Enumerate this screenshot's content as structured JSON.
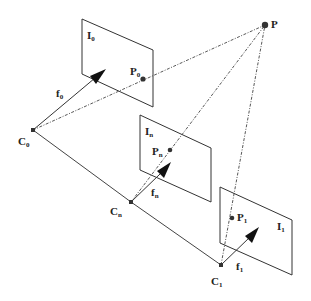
{
  "diagram": {
    "point": {
      "label": "P"
    },
    "cameras": [
      {
        "center_label": "C",
        "center_sub": "0",
        "focal_label": "f",
        "focal_sub": "0",
        "plane_label": "I",
        "plane_sub": "0",
        "projection_label": "P",
        "projection_sub": "0"
      },
      {
        "center_label": "C",
        "center_sub": "n",
        "focal_label": "f",
        "focal_sub": "n",
        "plane_label": "I",
        "plane_sub": "n",
        "projection_label": "P",
        "projection_sub": "n"
      },
      {
        "center_label": "C",
        "center_sub": "1",
        "focal_label": "f",
        "focal_sub": "1",
        "plane_label": "I",
        "plane_sub": "1",
        "projection_label": "P",
        "projection_sub": "1"
      }
    ],
    "colors": {
      "line": "#444444",
      "text": "#222222",
      "background": "#ffffff"
    }
  }
}
